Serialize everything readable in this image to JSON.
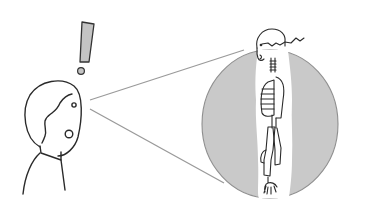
{
  "illustration": {
    "subject": "Person with exclamation mark seeing skeleton through magnifying circle",
    "exclamation_mark": "!",
    "colors": {
      "background": "#ffffff",
      "ink": "#2a2a2a",
      "circle_fill": "#c9c9c9",
      "circle_stroke": "#8f8f8f",
      "exclaim_fill": "#c4c4c4",
      "sightline": "#9a9a9a",
      "skeleton_halo": "#ffffff"
    }
  }
}
